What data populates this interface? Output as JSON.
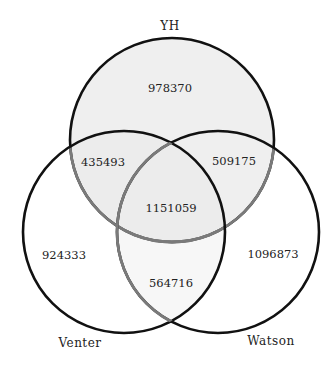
{
  "diagram": {
    "type": "venn-3",
    "sets": [
      {
        "id": "yh",
        "label": "YH",
        "cx": 172,
        "cy": 140,
        "r": 102
      },
      {
        "id": "venter",
        "label": "Venter",
        "cx": 124,
        "cy": 232,
        "r": 101
      },
      {
        "id": "watson",
        "label": "Watson",
        "cx": 218,
        "cy": 232,
        "r": 101
      }
    ],
    "regions": {
      "yh_only": "978370",
      "yh_venter": "435493",
      "yh_watson": "509175",
      "all_three": "1151059",
      "venter_only": "924333",
      "watson_only": "1096873",
      "venter_watson": "564716"
    },
    "colors": {
      "yh_fill": "#efefef",
      "lens_fill": "#f6f6f6",
      "stroke": "#111111",
      "inner_stroke": "#7a7a7a"
    }
  }
}
